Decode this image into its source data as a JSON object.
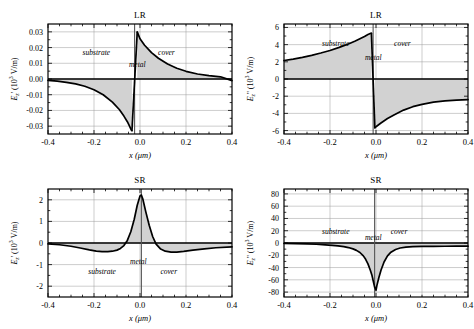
{
  "figure": {
    "xlabel": "x (μm)",
    "xticks": [
      "-0.4",
      "-0.2",
      "0.0",
      "0.2",
      "0.4"
    ],
    "xtick_values": [
      -0.4,
      -0.2,
      0.0,
      0.2,
      0.4
    ],
    "xlim": [
      -0.4,
      0.4
    ],
    "region_labels": {
      "substrate": "substrate",
      "metal": "metal",
      "cover": "cover"
    }
  },
  "chart_data": [
    {
      "id": "lr-real",
      "type": "line",
      "title": "LR",
      "position": "top-left",
      "xlabel": "x (μm)",
      "ylabel": "E₂' (10³ V/m)",
      "ylabel_parts": {
        "base": "E",
        "sub": "z",
        "prime": "'",
        "units": "(10",
        "exp": "3",
        "unit_tail": " V/m)"
      },
      "xlim": [
        -0.4,
        0.4
      ],
      "ylim": [
        -0.035,
        0.035
      ],
      "yticks": [
        "0.03",
        "0.02",
        "0.01",
        "0.00",
        "-0.01",
        "-0.02",
        "-0.03"
      ],
      "ytick_values": [
        0.03,
        0.02,
        0.01,
        0.0,
        -0.01,
        -0.02,
        -0.03
      ],
      "grid": true,
      "annotations": [
        {
          "text": "substrate",
          "x": -0.19,
          "y": 0.0175
        },
        {
          "text": "metal",
          "x": -0.012,
          "y": 0.0095
        },
        {
          "text": "cover",
          "x": 0.115,
          "y": 0.0175
        }
      ],
      "metal_interface": {
        "x_left": -0.035,
        "x_right": -0.012
      },
      "x": [
        -0.4,
        -0.36,
        -0.32,
        -0.28,
        -0.24,
        -0.2,
        -0.16,
        -0.12,
        -0.09,
        -0.07,
        -0.055,
        -0.045,
        -0.038,
        -0.035,
        -0.012,
        0.0,
        0.02,
        0.05,
        0.08,
        0.12,
        0.16,
        0.2,
        0.25,
        0.3,
        0.35,
        0.4
      ],
      "values": [
        -0.0009,
        -0.0014,
        -0.0021,
        -0.0031,
        -0.0046,
        -0.0068,
        -0.01,
        -0.0147,
        -0.0194,
        -0.0236,
        -0.0272,
        -0.0302,
        -0.0324,
        -0.033,
        0.03,
        0.0256,
        0.0215,
        0.0168,
        0.0132,
        0.0095,
        0.0068,
        0.0049,
        0.0032,
        0.0021,
        0.0014,
        -0.001
      ]
    },
    {
      "id": "lr-imag",
      "type": "line",
      "title": "LR",
      "position": "top-right",
      "xlabel": "x (μm)",
      "ylabel": "E₂'' (10³ V/m)",
      "ylabel_parts": {
        "base": "E",
        "sub": "z",
        "prime": "''",
        "units": "(10",
        "exp": "3",
        "unit_tail": " V/m)"
      },
      "xlim": [
        -0.4,
        0.4
      ],
      "ylim": [
        -6.4,
        6.4
      ],
      "yticks": [
        "6",
        "4",
        "2",
        "0",
        "-2",
        "-4",
        "-6"
      ],
      "ytick_values": [
        6,
        4,
        2,
        0,
        -2,
        -4,
        -6
      ],
      "grid": true,
      "annotations": [
        {
          "text": "substrate",
          "x": -0.175,
          "y": 4.15
        },
        {
          "text": "metal",
          "x": -0.012,
          "y": 2.55
        },
        {
          "text": "cover",
          "x": 0.115,
          "y": 4.15
        }
      ],
      "metal_interface": {
        "x_left": -0.02,
        "x_right": -0.005
      },
      "x": [
        -0.4,
        -0.36,
        -0.32,
        -0.28,
        -0.24,
        -0.2,
        -0.16,
        -0.12,
        -0.09,
        -0.07,
        -0.05,
        -0.035,
        -0.025,
        -0.02,
        -0.005,
        0.0,
        0.02,
        0.05,
        0.08,
        0.12,
        0.16,
        0.2,
        0.25,
        0.3,
        0.35,
        0.4
      ],
      "values": [
        2.15,
        2.32,
        2.52,
        2.75,
        3.02,
        3.32,
        3.68,
        4.08,
        4.42,
        4.68,
        4.95,
        5.18,
        5.3,
        5.35,
        -5.7,
        -5.55,
        -5.15,
        -4.6,
        -4.15,
        -3.62,
        -3.22,
        -2.95,
        -2.7,
        -2.55,
        -2.45,
        -2.4
      ]
    },
    {
      "id": "sr-real",
      "type": "line",
      "title": "SR",
      "position": "bottom-left",
      "xlabel": "x (μm)",
      "ylabel": "E₂' (10³ V/m)",
      "ylabel_parts": {
        "base": "E",
        "sub": "z",
        "prime": "'",
        "units": "(10",
        "exp": "3",
        "unit_tail": " V/m)"
      },
      "xlim": [
        -0.4,
        0.4
      ],
      "ylim": [
        -2.5,
        2.5
      ],
      "yticks": [
        "2",
        "1",
        "0",
        "-1",
        "-2"
      ],
      "ytick_values": [
        2,
        1,
        0,
        -1,
        -2
      ],
      "grid": true,
      "annotations": [
        {
          "text": "metal",
          "x": -0.007,
          "y": -0.82
        },
        {
          "text": "substrate",
          "x": -0.165,
          "y": -1.28
        },
        {
          "text": "cover",
          "x": 0.125,
          "y": -1.28
        }
      ],
      "metal_interface": {
        "x_left": 0.0,
        "x_right": 0.012
      },
      "x": [
        -0.4,
        -0.35,
        -0.3,
        -0.26,
        -0.22,
        -0.19,
        -0.165,
        -0.14,
        -0.12,
        -0.1,
        -0.085,
        -0.07,
        -0.055,
        -0.04,
        -0.025,
        -0.012,
        0.0,
        0.006,
        0.012,
        0.025,
        0.04,
        0.055,
        0.07,
        0.09,
        0.11,
        0.135,
        0.16,
        0.19,
        0.23,
        0.28,
        0.33,
        0.4
      ],
      "values": [
        -0.04,
        -0.08,
        -0.15,
        -0.23,
        -0.32,
        -0.38,
        -0.4,
        -0.4,
        -0.38,
        -0.33,
        -0.25,
        -0.12,
        0.12,
        0.52,
        1.1,
        1.75,
        2.18,
        2.22,
        2.05,
        1.45,
        0.82,
        0.3,
        -0.05,
        -0.28,
        -0.38,
        -0.42,
        -0.42,
        -0.39,
        -0.33,
        -0.27,
        -0.22,
        -0.18
      ]
    },
    {
      "id": "sr-imag",
      "type": "line",
      "title": "SR",
      "position": "bottom-right",
      "xlabel": "x (μm)",
      "ylabel": "E₂'' (10³ V/m)",
      "ylabel_parts": {
        "base": "E",
        "sub": "z",
        "prime": "''",
        "units": "(10",
        "exp": "3",
        "unit_tail": " V/m)"
      },
      "xlim": [
        -0.4,
        0.4
      ],
      "ylim": [
        -88,
        88
      ],
      "yticks": [
        "80",
        "60",
        "40",
        "20",
        "0",
        "-20",
        "-40",
        "-60",
        "-80"
      ],
      "ytick_values": [
        80,
        60,
        40,
        20,
        0,
        -20,
        -40,
        -60,
        -80
      ],
      "grid": true,
      "annotations": [
        {
          "text": "substrate",
          "x": -0.175,
          "y": 19.0
        },
        {
          "text": "metal",
          "x": -0.012,
          "y": 10.0
        },
        {
          "text": "cover",
          "x": 0.1,
          "y": 19.0
        }
      ],
      "metal_interface": {
        "x_left": -0.012,
        "x_right": 0.0
      },
      "x": [
        -0.4,
        -0.35,
        -0.3,
        -0.26,
        -0.22,
        -0.19,
        -0.165,
        -0.14,
        -0.12,
        -0.1,
        -0.085,
        -0.07,
        -0.055,
        -0.045,
        -0.035,
        -0.025,
        -0.018,
        -0.012,
        -0.006,
        0.0,
        0.004,
        0.012,
        0.022,
        0.035,
        0.05,
        0.065,
        0.085,
        0.105,
        0.13,
        0.16,
        0.2,
        0.25,
        0.3,
        0.35,
        0.4
      ],
      "values": [
        -0.6,
        -0.9,
        -1.4,
        -2.0,
        -2.9,
        -3.8,
        -4.7,
        -6.0,
        -7.4,
        -9.6,
        -12.0,
        -15.5,
        -21.0,
        -26.5,
        -34.0,
        -44.0,
        -52.0,
        -62.0,
        -72.0,
        -77.0,
        -69.0,
        -57.0,
        -44.0,
        -31.0,
        -21.0,
        -15.0,
        -10.5,
        -8.2,
        -6.8,
        -6.0,
        -5.6,
        -5.4,
        -5.3,
        -5.2,
        -5.2
      ]
    }
  ]
}
